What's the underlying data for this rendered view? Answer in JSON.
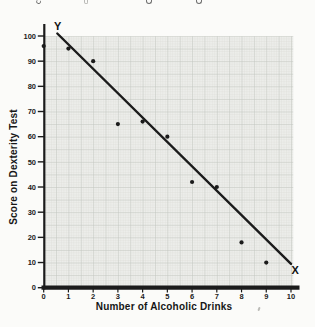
{
  "page": {
    "background": "#fbfbf9"
  },
  "chart_data": {
    "type": "scatter",
    "title": "",
    "xlabel": "Number of Alcoholic Drinks",
    "ylabel": "Score on Dexterity Test",
    "x_axis_end_label": "X",
    "y_axis_end_label": "Y",
    "xlim": [
      0,
      10
    ],
    "ylim": [
      0,
      100
    ],
    "x_ticks": [
      0,
      1,
      2,
      3,
      4,
      5,
      6,
      7,
      8,
      9,
      10
    ],
    "y_ticks": [
      0,
      10,
      20,
      30,
      40,
      50,
      60,
      70,
      80,
      90,
      100
    ],
    "grid": "graph-paper (fine squares, heavier line every 5 squares = 0.5 x-unit / 5 y-units)",
    "legend": "none",
    "points": [
      [
        0,
        96
      ],
      [
        1,
        95
      ],
      [
        2,
        90
      ],
      [
        3,
        65
      ],
      [
        4,
        66
      ],
      [
        5,
        60
      ],
      [
        6,
        42
      ],
      [
        7,
        40
      ],
      [
        8,
        18
      ],
      [
        9,
        10
      ]
    ],
    "fit_line": {
      "from": [
        0.55,
        101
      ],
      "to": [
        10.0,
        9.5
      ]
    },
    "colors": {
      "ink": "#1b1b1b",
      "point": "#1b1b1b",
      "plot_bg": "#ecedea",
      "grid_fine": "#d9dad5",
      "grid_major": "#c2c5c0",
      "page_bg": "#fbfbf9"
    }
  }
}
